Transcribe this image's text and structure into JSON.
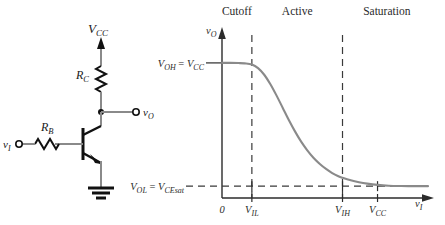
{
  "circuit": {
    "name": "bjt-inverter-schematic",
    "supply_label": "V",
    "supply_sub": "CC",
    "collector_resistor_label": "R",
    "collector_resistor_sub": "C",
    "base_resistor_label": "R",
    "base_resistor_sub": "B",
    "input_node_label": "v",
    "input_node_sub": "I",
    "output_node_label": "v",
    "output_node_sub": "O",
    "ground_symbol": "ground-icon",
    "transistor_type": "npn-bjt-icon",
    "wire_color": "#8a8a8a",
    "symbol_color": "#111111"
  },
  "chart_data": {
    "type": "line",
    "title": "",
    "xlabel": "v_I",
    "ylabel": "v_O",
    "xlabel_main": "v",
    "xlabel_sub": "I",
    "ylabel_main": "v",
    "ylabel_sub": "O",
    "grid": false,
    "legend": null,
    "xlim": [
      0,
      1.0
    ],
    "ylim": [
      0,
      1.0
    ],
    "curve_color": "#8a8a8a",
    "axis_color": "#2b2b2b",
    "dashed_color": "#3a3a3a",
    "x_ticks": [
      {
        "value": 0.0,
        "label_main": "0",
        "label_sub": ""
      },
      {
        "value": 0.145,
        "label_main": "V",
        "label_sub": "IL"
      },
      {
        "value": 0.585,
        "label_main": "V",
        "label_sub": "IH"
      },
      {
        "value": 0.755,
        "label_main": "V",
        "label_sub": "CC"
      }
    ],
    "y_ticks": [
      {
        "value": 0.855,
        "label": "V_OH = V_CC"
      },
      {
        "value": 0.075,
        "label": "V_OL = V_CEsat"
      }
    ],
    "y_label_high": {
      "p1": "V",
      "s1": "OH",
      "eq": " = ",
      "p2": "V",
      "s2": "CC"
    },
    "y_label_low": {
      "p1": "V",
      "s1": "OL",
      "eq": " = ",
      "p2": "V",
      "s2": "CEsat"
    },
    "regions": [
      {
        "name": "Cutoff",
        "label": "Cutoff",
        "x_center": 0.072
      },
      {
        "name": "Active",
        "label": "Active",
        "x_center": 0.365
      },
      {
        "name": "Saturation",
        "label": "Saturation",
        "x_center": 0.8
      }
    ],
    "series": [
      {
        "name": "vtc",
        "points": [
          [
            0.0,
            0.855
          ],
          [
            0.04,
            0.855
          ],
          [
            0.08,
            0.854
          ],
          [
            0.11,
            0.852
          ],
          [
            0.145,
            0.845
          ],
          [
            0.175,
            0.822
          ],
          [
            0.205,
            0.78
          ],
          [
            0.235,
            0.72
          ],
          [
            0.265,
            0.648
          ],
          [
            0.295,
            0.57
          ],
          [
            0.325,
            0.492
          ],
          [
            0.355,
            0.42
          ],
          [
            0.385,
            0.355
          ],
          [
            0.415,
            0.3
          ],
          [
            0.445,
            0.253
          ],
          [
            0.475,
            0.215
          ],
          [
            0.505,
            0.184
          ],
          [
            0.535,
            0.158
          ],
          [
            0.565,
            0.138
          ],
          [
            0.585,
            0.128
          ],
          [
            0.625,
            0.112
          ],
          [
            0.665,
            0.1
          ],
          [
            0.705,
            0.091
          ],
          [
            0.755,
            0.083
          ],
          [
            0.81,
            0.078
          ],
          [
            0.87,
            0.076
          ],
          [
            0.94,
            0.075
          ],
          [
            1.0,
            0.075
          ]
        ]
      }
    ],
    "annotations": [
      {
        "name": "vil-dashed-vertical",
        "type": "vline",
        "x": 0.145
      },
      {
        "name": "vih-dashed-vertical",
        "type": "vline",
        "x": 0.585
      },
      {
        "name": "vol-dashed-horizontal",
        "type": "hline",
        "y": 0.075
      }
    ]
  }
}
